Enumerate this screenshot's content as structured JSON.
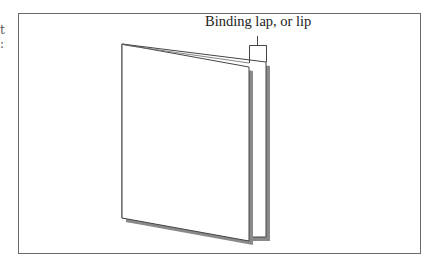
{
  "edge_fragments": [
    "t",
    ":"
  ],
  "diagram": {
    "label": "Binding lap, or lip",
    "colors": {
      "frame": "#6a6a6a",
      "page_stroke": "#444444",
      "page_fill": "#ffffff",
      "shadow": "#8a8a8a"
    }
  }
}
